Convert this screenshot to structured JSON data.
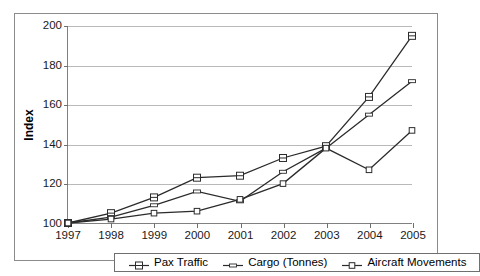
{
  "chart_data": {
    "type": "line",
    "title": "",
    "xlabel": "",
    "ylabel": "Index",
    "categories": [
      "1997",
      "1998",
      "1999",
      "2000",
      "2001",
      "2002",
      "2003",
      "2004",
      "2005"
    ],
    "x": [
      1997,
      1998,
      1999,
      2000,
      2001,
      2002,
      2003,
      2004,
      2005
    ],
    "xlim": [
      1997,
      2005
    ],
    "ylim": [
      100,
      200
    ],
    "yticks": [
      100,
      120,
      140,
      160,
      180,
      200
    ],
    "ytick_labels": [
      "100",
      "120",
      "140",
      "160",
      "180",
      "200"
    ],
    "grid": true,
    "grid_axis": "y",
    "legend_position": "bottom",
    "series": [
      {
        "name": "Pax Traffic",
        "marker": "square",
        "color": "#2b2b2b",
        "values": [
          100,
          105,
          113,
          123,
          124,
          133,
          139,
          164,
          195
        ]
      },
      {
        "name": "Cargo (Tonnes)",
        "marker": "dash",
        "color": "#2b2b2b",
        "values": [
          100,
          103,
          109,
          116,
          111,
          126,
          138,
          155,
          172
        ]
      },
      {
        "name": "Aircraft Movements",
        "marker": "small-square",
        "color": "#2b2b2b",
        "values": [
          100,
          102,
          105,
          106,
          112,
          120,
          138,
          127,
          147
        ]
      }
    ]
  },
  "legend": {
    "items": [
      {
        "label": "Pax Traffic"
      },
      {
        "label": "Cargo (Tonnes)"
      },
      {
        "label": "Aircraft Movements"
      }
    ]
  }
}
